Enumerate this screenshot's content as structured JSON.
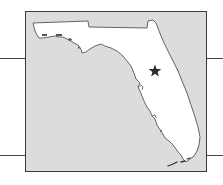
{
  "map": {
    "region": "Florida",
    "marker": {
      "type": "star",
      "icon": "star-icon",
      "description": "Marked location in central Florida"
    },
    "colors": {
      "water": "#dcdcdc",
      "land": "#ffffff",
      "outline": "#555555",
      "marker": "#2a2a2a",
      "frame": "#3a3a3a",
      "rules": "#444444"
    }
  }
}
